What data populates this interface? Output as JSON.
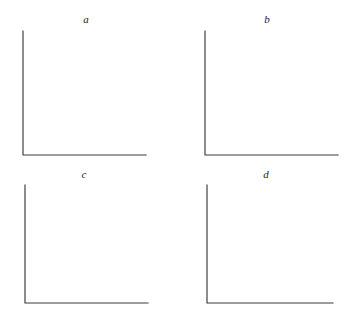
{
  "figure": {
    "type": "multi-panel-axes-template",
    "background_color": "#ffffff",
    "axis_color": "#3a3a3a",
    "label_color": "#222222",
    "panel_count": 4,
    "layout": "2x2 grid",
    "panels": [
      {
        "id": "a",
        "label": "a",
        "label_x": 86,
        "label_y": 14,
        "origin_x": 23,
        "origin_y": 155,
        "y_axis_top": 31,
        "x_axis_right": 146,
        "xlabel": "",
        "ylabel": "",
        "tick_labels_x": [],
        "tick_labels_y": [],
        "series": []
      },
      {
        "id": "b",
        "label": "b",
        "label_x": 267,
        "label_y": 14,
        "origin_x": 205,
        "origin_y": 155,
        "y_axis_top": 31,
        "x_axis_right": 338,
        "xlabel": "",
        "ylabel": "",
        "tick_labels_x": [],
        "tick_labels_y": [],
        "series": []
      },
      {
        "id": "c",
        "label": "c",
        "label_x": 84,
        "label_y": 169,
        "origin_x": 25,
        "origin_y": 303,
        "y_axis_top": 185,
        "x_axis_right": 148,
        "xlabel": "",
        "ylabel": "",
        "tick_labels_x": [],
        "tick_labels_y": [],
        "series": []
      },
      {
        "id": "d",
        "label": "d",
        "label_x": 266,
        "label_y": 169,
        "origin_x": 207,
        "origin_y": 303,
        "y_axis_top": 185,
        "x_axis_right": 333,
        "xlabel": "",
        "ylabel": "",
        "tick_labels_x": [],
        "tick_labels_y": [],
        "series": []
      }
    ]
  },
  "chart_data": {
    "type": "line",
    "title": "",
    "subtitle": "",
    "xlabel": "",
    "ylabel": "",
    "grid": false,
    "legend": false,
    "legend_position": "none",
    "annotations": [],
    "panels": [
      {
        "panel_label": "a",
        "x": [],
        "series": [],
        "xlim": [
          0,
          1
        ],
        "ylim": [
          0,
          1
        ],
        "xticks": [],
        "yticks": [],
        "xticklabels": [],
        "yticklabels": []
      },
      {
        "panel_label": "b",
        "x": [],
        "series": [],
        "xlim": [
          0,
          1
        ],
        "ylim": [
          0,
          1
        ],
        "xticks": [],
        "yticks": [],
        "xticklabels": [],
        "yticklabels": []
      },
      {
        "panel_label": "c",
        "x": [],
        "series": [],
        "xlim": [
          0,
          1
        ],
        "ylim": [
          0,
          1
        ],
        "xticks": [],
        "yticks": [],
        "xticklabels": [],
        "yticklabels": []
      },
      {
        "panel_label": "d",
        "x": [],
        "series": [],
        "xlim": [
          0,
          1
        ],
        "ylim": [
          0,
          1
        ],
        "xticks": [],
        "yticks": [],
        "xticklabels": [],
        "yticklabels": []
      }
    ]
  }
}
